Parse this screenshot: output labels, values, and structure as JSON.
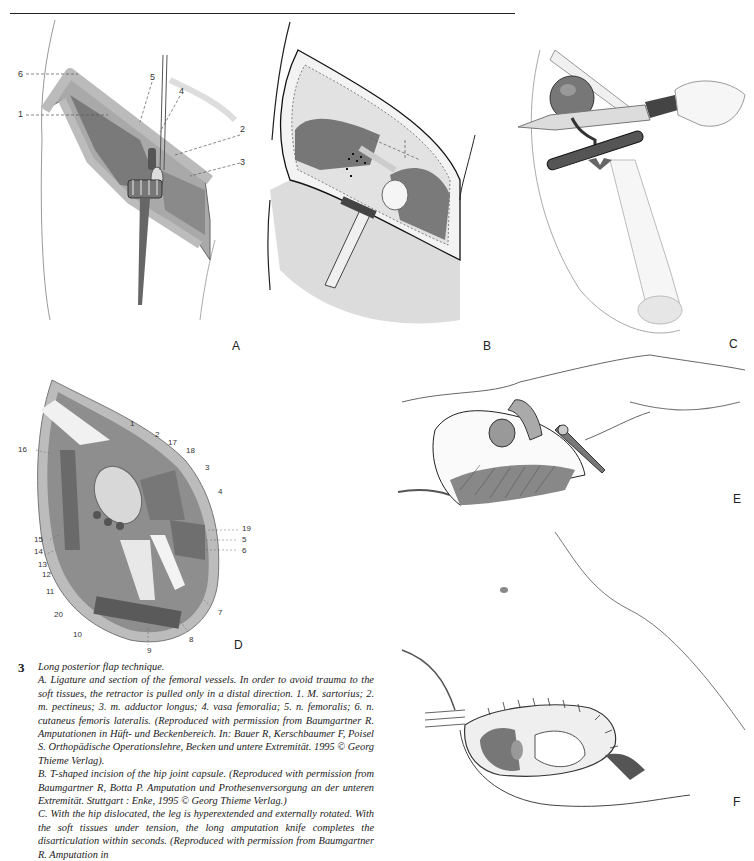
{
  "page": {
    "header_rule": true
  },
  "panels": {
    "A": {
      "letter": "A",
      "callouts": [
        "1",
        "2",
        "3",
        "4",
        "5",
        "6"
      ]
    },
    "B": {
      "letter": "B"
    },
    "C": {
      "letter": "C"
    },
    "D": {
      "letter": "D",
      "callouts": [
        "1",
        "2",
        "3",
        "4",
        "5",
        "6",
        "7",
        "8",
        "9",
        "10",
        "11",
        "12",
        "13",
        "14",
        "15",
        "16",
        "17",
        "18",
        "19",
        "20"
      ]
    },
    "E": {
      "letter": "E"
    },
    "F": {
      "letter": "F"
    }
  },
  "caption": {
    "figure_number": "3",
    "title": "Long posterior flap technique.",
    "paragraphs": [
      "A. Ligature and section of the femoral vessels. In order to avoid trauma to the soft tissues, the retractor is pulled only in a distal direction. 1. M. sartorius; 2. m. pectineus; 3. m. adductor longus; 4. vasa femoralia; 5. n. femoralis; 6. n. cutaneus femoris lateralis. (Reproduced with permission from Baumgartner R. Amputationen in Hüft- und Beckenbereich. In: Bauer R, Kerschbaumer F, Poisel S. Orthopädische Operationslehre, Becken und untere Extremität. 1995 © Georg Thieme Verlag).",
      "B. T-shaped incision of the hip joint capsule. (Reproduced with permission from Baumgartner R, Botta P. Amputation und Prothesenversorgung an der unteren Extremität. Stuttgart : Enke, 1995 © Georg Thieme Verlag.)",
      "C. With the hip dislocated, the leg is hyperextended and externally rotated. With the soft tissues under tension, the long amputation knife completes the disarticulation within seconds. (Reproduced with permission from Baumgartner R. Amputation in"
    ]
  },
  "colors": {
    "ink": "#1a1a1a",
    "tissue_dark": "#6e6e6e",
    "tissue_mid": "#9a9a9a",
    "tissue_light": "#cfcfcf",
    "skin": "#f2f2f2"
  }
}
